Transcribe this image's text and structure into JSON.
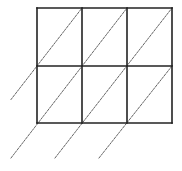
{
  "diagram": {
    "type": "lattice-multiplication-grid",
    "rows": 2,
    "columns": 3,
    "grid": {
      "x_lines": [
        37,
        82,
        127,
        172
      ],
      "y_lines": [
        8,
        66,
        123
      ],
      "stroke": "#222222",
      "stroke_width": 1.6
    },
    "diagonals": [
      {
        "x1": 11,
        "y1": 99.5,
        "x2": 82,
        "y2": 8
      },
      {
        "x1": 11,
        "y1": 158,
        "x2": 127,
        "y2": 8
      },
      {
        "x1": 55,
        "y1": 158,
        "x2": 172,
        "y2": 8
      },
      {
        "x1": 99,
        "y1": 158,
        "x2": 172,
        "y2": 66
      }
    ],
    "diagonal_style": {
      "stroke": "#555555",
      "stroke_width": 0.9,
      "dash": "2,1.5"
    },
    "background": "#ffffff"
  }
}
